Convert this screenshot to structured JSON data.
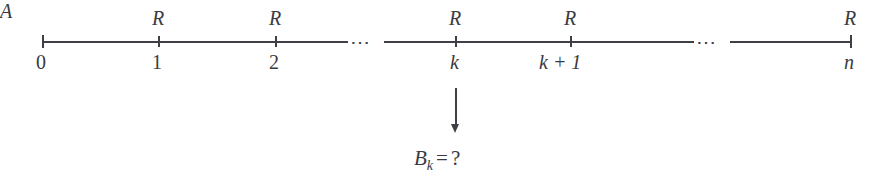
{
  "diagram": {
    "type": "number-line-filtration",
    "axis": {
      "start_label": "0",
      "end_label": "n",
      "color": "#3f3f45"
    },
    "ticks": [
      {
        "id": "t0",
        "x": 42,
        "below": "0",
        "above": "",
        "italic_below": false,
        "end": true
      },
      {
        "id": "t1",
        "x": 158,
        "below": "1",
        "above": "R",
        "italic_below": false,
        "end": false
      },
      {
        "id": "t2",
        "x": 275,
        "below": "2",
        "above": "R",
        "italic_below": false,
        "end": false
      },
      {
        "id": "tk",
        "x": 455,
        "below": "k",
        "above": "R",
        "italic_below": true,
        "end": false
      },
      {
        "id": "tk1",
        "x": 570,
        "below": "k + 1",
        "above": "R",
        "italic_below": true,
        "end": false
      },
      {
        "id": "tn",
        "x": 850,
        "below": "n",
        "above": "R",
        "italic_below": true,
        "end": true
      }
    ],
    "ellipses": [
      {
        "id": "gap1",
        "x": 352,
        "text": "⋯"
      },
      {
        "id": "gap2",
        "x": 698,
        "text": "⋯"
      }
    ],
    "module_label": "A",
    "arrow": {
      "x": 455,
      "from_y": 88,
      "to_y": 133
    },
    "answer": {
      "base": "B",
      "subscript": "k",
      "equals": "=",
      "value": "?"
    }
  }
}
